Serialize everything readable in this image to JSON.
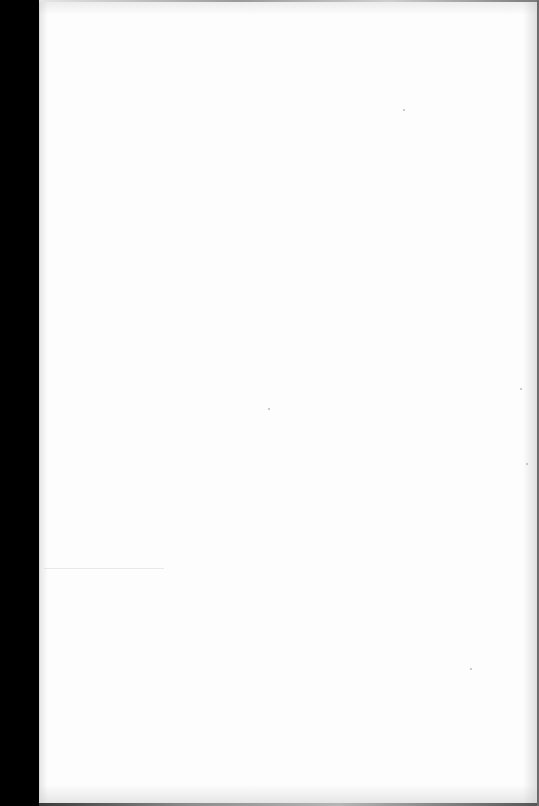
{
  "document": {
    "type": "scanned-page",
    "content": "",
    "is_blank": true
  },
  "colors": {
    "page": "#fdfdfd",
    "binding_strip": "#000000",
    "scan_edge": "#9a9a9a"
  }
}
